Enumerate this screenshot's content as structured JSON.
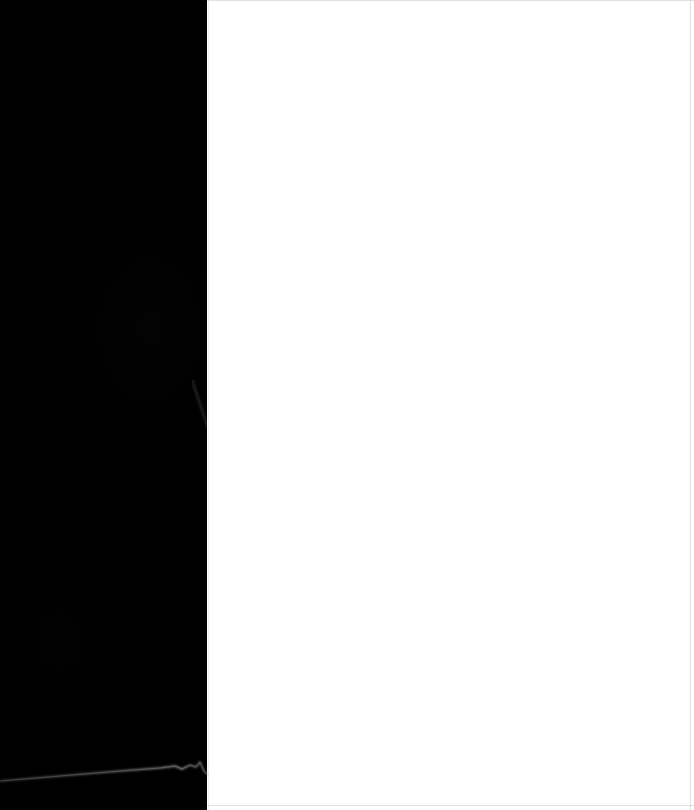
{
  "frame": {
    "width": 694,
    "height": 810,
    "title": "Blank split frame",
    "description": "Near-empty capture: solid black left panel beside a blank white panel, with a faint light streak crossing the lower black area."
  },
  "panels": {
    "dark": {
      "name": "dark-panel",
      "label": "",
      "color": "#000000",
      "x": 0,
      "y": 0,
      "width": 207,
      "height": 810,
      "content": ""
    },
    "light": {
      "name": "light-panel",
      "label": "",
      "color": "#ffffff",
      "x": 207,
      "y": 0,
      "width": 487,
      "height": 810,
      "content": ""
    }
  },
  "edges": {
    "color": "#c9c9cc",
    "top": {
      "label": ""
    },
    "right": {
      "label": ""
    },
    "bottom": {
      "label": ""
    },
    "left": {
      "label": ""
    }
  },
  "streak": {
    "name": "light-streak",
    "color": "#9a9a9a",
    "label": "",
    "entry_y": 781,
    "exit_y": 769,
    "path": "M 0 46 L 120 36 L 160 33 L 175 31 L 182 34 L 190 30 L 196 32 L 200 27 L 204 36 L 208 40"
  },
  "overlays": {
    "seam_scuff": {
      "label": ""
    },
    "dark_texture": {
      "label": ""
    }
  }
}
